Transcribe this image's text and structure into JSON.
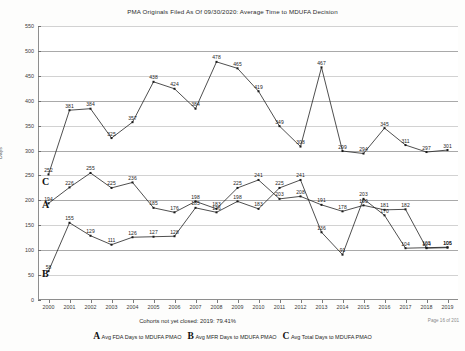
{
  "chart_data": {
    "type": "line",
    "title": "PMA Originals  Filed As Of 09/30/2020: Average Time to MDUFA Decision",
    "xlabel": "",
    "ylabel": "Days",
    "ylim": [
      0,
      550
    ],
    "yticks": [
      0,
      50,
      100,
      150,
      200,
      250,
      300,
      350,
      400,
      450,
      500,
      550
    ],
    "grid": true,
    "legend_position": "bottom",
    "categories": [
      "2000",
      "2001",
      "2002",
      "2003",
      "2004",
      "2005",
      "2006",
      "2007",
      "2008",
      "2009",
      "2010",
      "2011",
      "2012",
      "2013",
      "2014",
      "2015",
      "2016",
      "2017",
      "2018",
      "2019"
    ],
    "series": [
      {
        "key": "A",
        "name": "Avg FDA Days to MDUFA PMAO",
        "values": [
          58,
          155,
          129,
          111,
          126,
          127,
          128,
          185,
          176,
          198,
          183,
          225,
          241,
          136,
          91,
          203,
          170,
          104,
          105,
          106
        ]
      },
      {
        "key": "B",
        "name": "Avg MFR Days to MDUFA PMAO",
        "values": [
          194,
          226,
          255,
          225,
          236,
          185,
          176,
          198,
          183,
          225,
          241,
          203,
          208,
          191,
          178,
          190,
          181,
          182,
          104,
          105
        ]
      },
      {
        "key": "C",
        "name": "Avg Total Days to MDUFA PMAO",
        "values": [
          252,
          381,
          384,
          325,
          357,
          438,
          424,
          384,
          478,
          465,
          419,
          349,
          308,
          467,
          299,
          294,
          345,
          311,
          297,
          301
        ]
      }
    ],
    "annotations": {
      "cohort_note": "Cohorts not yet closed: 2019: 79.41%",
      "page_number": "Page 16 of 201"
    }
  }
}
